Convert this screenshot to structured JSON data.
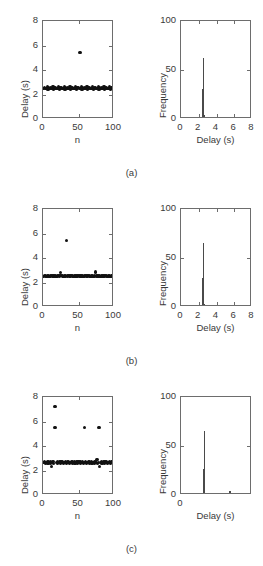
{
  "figure": {
    "background": "#ffffff",
    "axis_color": "#6d6d6d",
    "marker_color": "#111111",
    "bar_color": "#4a4a4a",
    "panel_labels": [
      "(a)",
      "(b)",
      "(c)"
    ]
  },
  "chart_data": [
    {
      "type": "scatter",
      "panel": "(a)",
      "position": "left",
      "title": "",
      "xlabel": "n",
      "ylabel": "Delay (s)",
      "xlim": [
        0,
        100
      ],
      "ylim": [
        0,
        8
      ],
      "xticks": [
        0,
        50,
        100
      ],
      "yticks": [
        0,
        2,
        4,
        6,
        8
      ],
      "grid": false,
      "legend": null,
      "x": [
        1,
        2,
        3,
        4,
        5,
        6,
        7,
        8,
        9,
        10,
        11,
        12,
        13,
        14,
        15,
        16,
        17,
        18,
        19,
        20,
        21,
        22,
        23,
        24,
        25,
        26,
        27,
        28,
        29,
        30,
        31,
        32,
        33,
        34,
        35,
        36,
        37,
        38,
        39,
        40,
        41,
        42,
        43,
        44,
        45,
        46,
        47,
        48,
        49,
        50,
        51,
        52,
        53,
        54,
        55,
        56,
        57,
        58,
        59,
        60,
        61,
        62,
        63,
        64,
        65,
        66,
        67,
        68,
        69,
        70,
        71,
        72,
        73,
        74,
        75,
        76,
        77,
        78,
        79,
        80,
        81,
        82,
        83,
        84,
        85,
        86,
        87,
        88,
        89,
        90,
        91,
        92,
        93,
        94,
        95,
        96,
        97,
        98,
        99,
        100
      ],
      "y": [
        2.47,
        2.6,
        2.46,
        2.52,
        2.47,
        2.61,
        2.45,
        2.53,
        2.48,
        2.6,
        2.46,
        2.51,
        2.47,
        2.62,
        2.45,
        2.54,
        2.47,
        2.6,
        2.46,
        2.52,
        2.48,
        2.61,
        2.45,
        2.53,
        2.47,
        2.6,
        2.46,
        2.51,
        2.48,
        2.62,
        2.45,
        2.54,
        2.47,
        2.6,
        2.46,
        2.52,
        2.47,
        2.61,
        2.45,
        2.53,
        2.48,
        2.6,
        2.46,
        2.51,
        2.47,
        2.62,
        2.45,
        2.54,
        2.47,
        2.6,
        2.46,
        5.42,
        2.48,
        2.61,
        2.45,
        2.53,
        2.47,
        2.6,
        2.46,
        2.51,
        2.48,
        2.62,
        2.45,
        2.54,
        2.47,
        2.6,
        2.46,
        2.52,
        2.47,
        2.61,
        2.45,
        2.53,
        2.48,
        2.6,
        2.46,
        2.51,
        2.47,
        2.62,
        2.45,
        2.54,
        2.47,
        2.6,
        2.46,
        2.52,
        2.48,
        2.61,
        2.45,
        2.53,
        2.47,
        2.6,
        2.46,
        2.51,
        2.48,
        2.62,
        2.45,
        2.54,
        2.47,
        2.6,
        2.46,
        2.52
      ]
    },
    {
      "type": "bar",
      "panel": "(a)",
      "position": "right",
      "title": "",
      "xlabel": "Delay (s)",
      "ylabel": "Frequency",
      "xlim": [
        0,
        8
      ],
      "ylim": [
        0,
        100
      ],
      "xticks": [
        0,
        2,
        4,
        6,
        8
      ],
      "yticks": [
        0,
        50,
        100
      ],
      "grid": false,
      "legend": null,
      "bin_centers": [
        2.45,
        2.55,
        2.65,
        2.75,
        5.45
      ],
      "values": [
        31,
        62,
        4,
        2,
        1
      ]
    },
    {
      "type": "scatter",
      "panel": "(b)",
      "position": "left",
      "title": "",
      "xlabel": "n",
      "ylabel": "Delay (s)",
      "xlim": [
        0,
        100
      ],
      "ylim": [
        0,
        8
      ],
      "xticks": [
        0,
        50,
        100
      ],
      "yticks": [
        0,
        2,
        4,
        6,
        8
      ],
      "grid": false,
      "legend": null,
      "x": [
        1,
        2,
        3,
        4,
        5,
        6,
        7,
        8,
        9,
        10,
        11,
        12,
        13,
        14,
        15,
        16,
        17,
        18,
        19,
        20,
        21,
        22,
        23,
        24,
        25,
        26,
        27,
        28,
        29,
        30,
        31,
        32,
        33,
        34,
        35,
        36,
        37,
        38,
        39,
        40,
        41,
        42,
        43,
        44,
        45,
        46,
        47,
        48,
        49,
        50,
        51,
        52,
        53,
        54,
        55,
        56,
        57,
        58,
        59,
        60,
        61,
        62,
        63,
        64,
        65,
        66,
        67,
        68,
        69,
        70,
        71,
        72,
        73,
        74,
        75,
        76,
        77,
        78,
        79,
        80,
        81,
        82,
        83,
        84,
        85,
        86,
        87,
        88,
        89,
        90,
        91,
        92,
        93,
        94,
        95,
        96,
        97,
        98,
        99,
        100
      ],
      "y": [
        2.5,
        2.58,
        2.49,
        2.56,
        2.51,
        2.59,
        2.48,
        2.57,
        2.5,
        2.58,
        2.49,
        2.56,
        2.51,
        2.59,
        2.48,
        2.57,
        2.5,
        2.58,
        2.49,
        2.56,
        2.51,
        2.59,
        2.48,
        2.57,
        2.84,
        2.58,
        2.49,
        2.56,
        2.51,
        2.59,
        2.48,
        2.57,
        5.45,
        2.58,
        2.49,
        2.56,
        2.51,
        2.59,
        2.48,
        2.57,
        2.5,
        2.58,
        2.49,
        2.56,
        2.51,
        2.59,
        2.48,
        2.57,
        2.5,
        2.58,
        2.49,
        2.56,
        2.51,
        2.59,
        2.48,
        2.57,
        2.5,
        2.58,
        2.49,
        2.56,
        2.51,
        2.59,
        2.48,
        2.57,
        2.5,
        2.58,
        2.49,
        2.56,
        2.51,
        2.59,
        2.48,
        2.57,
        2.5,
        2.86,
        2.49,
        2.56,
        2.51,
        2.59,
        2.48,
        2.57,
        2.5,
        2.58,
        2.49,
        2.56,
        2.51,
        2.59,
        2.48,
        2.57,
        2.5,
        2.58,
        2.49,
        2.56,
        2.51,
        2.59,
        2.48,
        2.57,
        2.5,
        2.58,
        2.49,
        2.56
      ]
    },
    {
      "type": "bar",
      "panel": "(b)",
      "position": "right",
      "title": "",
      "xlabel": "Delay (s)",
      "ylabel": "Frequency",
      "xlim": [
        0,
        8
      ],
      "ylim": [
        0,
        100
      ],
      "xticks": [
        0,
        2,
        4,
        6,
        8
      ],
      "yticks": [
        0,
        50,
        100
      ],
      "grid": false,
      "legend": null,
      "bin_centers": [
        2.45,
        2.55,
        2.65,
        2.85,
        5.45
      ],
      "values": [
        30,
        65,
        3,
        2,
        1
      ]
    },
    {
      "type": "scatter",
      "panel": "(c)",
      "position": "left",
      "title": "",
      "xlabel": "n",
      "ylabel": "Delay (s)",
      "xlim": [
        0,
        100
      ],
      "ylim": [
        0,
        8
      ],
      "xticks": [
        0,
        50,
        100
      ],
      "yticks": [
        0,
        2,
        4,
        6,
        8
      ],
      "grid": false,
      "legend": null,
      "x": [
        1,
        2,
        3,
        4,
        5,
        6,
        7,
        8,
        9,
        10,
        11,
        12,
        13,
        14,
        15,
        16,
        17,
        18,
        19,
        20,
        21,
        22,
        23,
        24,
        25,
        26,
        27,
        28,
        29,
        30,
        31,
        32,
        33,
        34,
        35,
        36,
        37,
        38,
        39,
        40,
        41,
        42,
        43,
        44,
        45,
        46,
        47,
        48,
        49,
        50,
        51,
        52,
        53,
        54,
        55,
        56,
        57,
        58,
        59,
        60,
        61,
        62,
        63,
        64,
        65,
        66,
        67,
        68,
        69,
        70,
        71,
        72,
        73,
        74,
        75,
        76,
        77,
        78,
        79,
        80,
        81,
        82,
        83,
        84,
        85,
        86,
        87,
        88,
        89,
        90,
        91,
        92,
        93,
        94,
        95,
        96,
        97,
        98,
        99,
        100
      ],
      "y": [
        2.62,
        2.7,
        2.6,
        2.68,
        2.63,
        2.71,
        2.59,
        2.69,
        2.62,
        2.7,
        2.6,
        2.3,
        2.63,
        2.71,
        2.59,
        5.5,
        7.25,
        5.52,
        2.62,
        2.7,
        2.6,
        2.68,
        2.63,
        2.71,
        2.59,
        2.69,
        2.62,
        2.7,
        2.6,
        2.68,
        2.63,
        2.71,
        2.59,
        2.69,
        2.62,
        2.7,
        2.6,
        2.68,
        2.63,
        2.71,
        2.59,
        2.69,
        2.62,
        2.7,
        2.6,
        2.68,
        2.63,
        2.71,
        2.59,
        2.69,
        2.62,
        2.7,
        2.6,
        2.68,
        2.63,
        2.71,
        2.59,
        5.5,
        2.62,
        2.7,
        2.6,
        2.68,
        2.63,
        2.71,
        2.59,
        2.69,
        2.62,
        2.7,
        2.6,
        2.68,
        2.63,
        2.71,
        2.59,
        2.69,
        2.62,
        2.92,
        2.6,
        2.68,
        5.5,
        2.35,
        2.62,
        2.7,
        2.6,
        2.68,
        2.63,
        2.71,
        2.59,
        2.69,
        2.62,
        2.7,
        2.6,
        2.68,
        2.63,
        2.71,
        2.59,
        2.69,
        2.62,
        2.7,
        2.6,
        2.68
      ]
    },
    {
      "type": "bar",
      "panel": "(c)",
      "position": "right",
      "title": "",
      "xlabel": "Delay (s)",
      "ylabel": "Frequency",
      "xlim": [
        0,
        8
      ],
      "ylim": [
        0,
        100
      ],
      "xticks": [
        0,
        50,
        100
      ],
      "yticks": [
        0,
        50,
        100
      ],
      "grid": false,
      "legend": null,
      "bin_centers": [
        2.35,
        2.55,
        2.65,
        2.9,
        5.5,
        7.25
      ],
      "values": [
        2,
        27,
        65,
        2,
        4,
        1
      ]
    }
  ]
}
